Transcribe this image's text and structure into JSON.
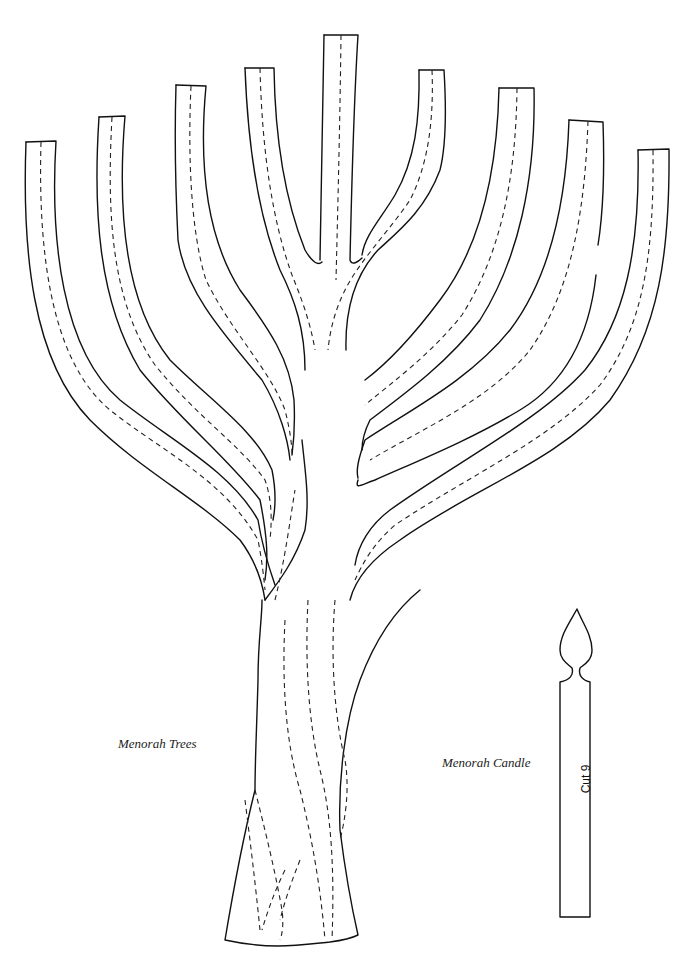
{
  "document": {
    "type": "craft cutting pattern",
    "colors": {
      "background": "#ffffff",
      "line": "#111111"
    }
  },
  "tree": {
    "caption": "Menorah Trees",
    "branch_count": 9,
    "cut_line_style": "solid",
    "fold_line_style": "dashed"
  },
  "candle": {
    "caption": "Menorah Candle",
    "label": "Cut 9"
  }
}
